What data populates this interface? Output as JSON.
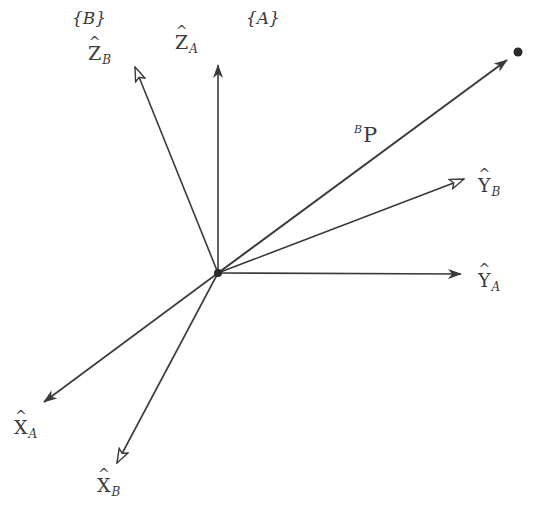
{
  "diagram": {
    "type": "coordinate-frames",
    "frames": [
      {
        "id": "B",
        "label": "{B}"
      },
      {
        "id": "A",
        "label": "{A}"
      }
    ],
    "origin": {
      "x": 218,
      "y": 273
    },
    "axes": [
      {
        "id": "ZB",
        "base": "Z",
        "hat": "^",
        "sub": "B",
        "frame": "B",
        "arrow": "open",
        "tip": {
          "x": 135,
          "y": 67
        }
      },
      {
        "id": "ZA",
        "base": "Z",
        "hat": "^",
        "sub": "A",
        "frame": "A",
        "arrow": "filled",
        "tip": {
          "x": 218,
          "y": 65
        }
      },
      {
        "id": "YB",
        "base": "Y",
        "hat": "^",
        "sub": "B",
        "frame": "B",
        "arrow": "open",
        "tip": {
          "x": 464,
          "y": 179
        }
      },
      {
        "id": "YA",
        "base": "Y",
        "hat": "^",
        "sub": "A",
        "frame": "A",
        "arrow": "filled",
        "tip": {
          "x": 461,
          "y": 274
        }
      },
      {
        "id": "XA",
        "base": "X",
        "hat": "^",
        "sub": "A",
        "frame": "A",
        "arrow": "filled",
        "tip": {
          "x": 44,
          "y": 402
        }
      },
      {
        "id": "XB",
        "base": "X",
        "hat": "^",
        "sub": "B",
        "frame": "B",
        "arrow": "open",
        "tip": {
          "x": 117,
          "y": 463
        }
      }
    ],
    "vector": {
      "label_sup": "B",
      "label_base": "P",
      "arrow": "filled",
      "tip": {
        "x": 507,
        "y": 60
      }
    },
    "point": {
      "x": 518,
      "y": 52
    },
    "colors": {
      "line": "#3a3a3a",
      "text": "#3a3a3a",
      "background": "#ffffff"
    }
  }
}
